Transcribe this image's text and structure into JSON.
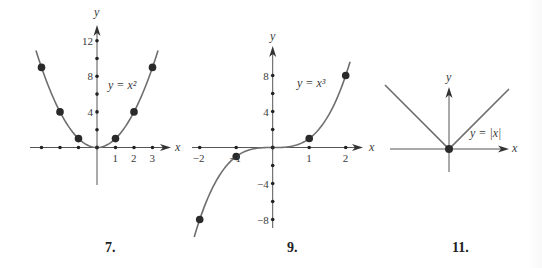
{
  "colors": {
    "curve": "#6e6e6e",
    "axis": "#555555",
    "point": "#2a2a2a",
    "text": "#3a3a3a"
  },
  "chart_data": [
    {
      "type": "line",
      "figure_number": "7.",
      "formula": "y = x²",
      "function": "x^2",
      "xlabel": "x",
      "ylabel": "y",
      "x_tick_labels": [
        "1",
        "2",
        "3"
      ],
      "x_ticks": [
        -3,
        -2,
        -1,
        1,
        2,
        3
      ],
      "y_tick_labels": [
        "4",
        "8",
        "12"
      ],
      "y_ticks": [
        2,
        4,
        6,
        8,
        10,
        12
      ],
      "points": [
        [
          -3,
          9
        ],
        [
          -2,
          4
        ],
        [
          -1,
          1
        ],
        [
          0,
          0
        ],
        [
          1,
          1
        ],
        [
          2,
          4
        ],
        [
          3,
          9
        ]
      ],
      "xlim": [
        -3.5,
        3.5
      ],
      "ylim": [
        -4,
        13
      ],
      "grid": false,
      "layout": {
        "ox": 97,
        "oy": 147.5,
        "sx": 18.5,
        "sy": 8.9,
        "xaxis": [
          30,
          171
        ],
        "yaxis": [
          185,
          25
        ],
        "curve_range": [
          -3.3,
          3.3
        ],
        "fig_x": 105,
        "fig_y": 252,
        "formula_x": 108,
        "formula_y": 89,
        "xlabel_x": 175,
        "xlabel_y": 151,
        "ylabel_x": 94,
        "ylabel_y": 16
      }
    },
    {
      "type": "line",
      "figure_number": "9.",
      "formula": "y = x³",
      "function": "x^3",
      "xlabel": "x",
      "ylabel": "y",
      "x_tick_labels": [
        "−2",
        "−1",
        "1",
        "2"
      ],
      "x_ticks": [
        -2,
        -1,
        1,
        2
      ],
      "y_tick_labels": [
        "8",
        "4",
        "−4",
        "−8"
      ],
      "y_ticks": [
        -8,
        -6,
        -4,
        -2,
        2,
        4,
        6,
        8
      ],
      "points": [
        [
          -2,
          -8
        ],
        [
          -1,
          -1
        ],
        [
          0,
          0
        ],
        [
          1,
          1
        ],
        [
          2,
          8
        ]
      ],
      "xlim": [
        -2.3,
        2.3
      ],
      "ylim": [
        -9.5,
        9.5
      ],
      "grid": false,
      "layout": {
        "ox": 272.7,
        "oy": 147.5,
        "sx": 36.5,
        "sy": 9,
        "xaxis": [
          192,
          363
        ],
        "yaxis": [
          228,
          46
        ],
        "curve_range": [
          -2.15,
          2.12
        ],
        "fig_x": 287,
        "fig_y": 252,
        "formula_x": 297,
        "formula_y": 87,
        "xlabel_x": 369,
        "xlabel_y": 151,
        "ylabel_x": 270,
        "ylabel_y": 40
      }
    },
    {
      "type": "line",
      "figure_number": "11.",
      "formula": "y = |x|",
      "function": "abs(x)",
      "xlabel": "x",
      "ylabel": "y",
      "x_tick_labels": [],
      "x_ticks": [],
      "y_tick_labels": [],
      "y_ticks": [],
      "points": [
        [
          0,
          0
        ]
      ],
      "grid": false,
      "layout": {
        "ox": 449,
        "oy": 149,
        "sx": 1,
        "sy": 1,
        "xaxis": [
          390,
          509
        ],
        "yaxis": [
          172,
          87
        ],
        "curve_range": [
          -64,
          60
        ],
        "fig_x": 452,
        "fig_y": 252,
        "formula_x": 470,
        "formula_y": 137,
        "xlabel_x": 512,
        "xlabel_y": 152,
        "ylabel_x": 446,
        "ylabel_y": 81
      }
    }
  ]
}
